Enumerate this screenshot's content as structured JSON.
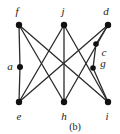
{
  "figure": {
    "caption": "(b)",
    "width": 120,
    "height": 134,
    "background": "#ffffff",
    "edge_color": "#2b2b2b",
    "vertex_color": "#111111",
    "label_color": "#1a1a1a"
  },
  "chart_data": {
    "type": "diagram",
    "subtype": "undirected-graph",
    "title": "(b)",
    "vertices": [
      {
        "id": "f",
        "label": "f",
        "x": 19,
        "y": 25,
        "label_x": 17,
        "label_y": 11,
        "r": 3.2
      },
      {
        "id": "j",
        "label": "j",
        "x": 64,
        "y": 25,
        "label_x": 63,
        "label_y": 11,
        "r": 3.2
      },
      {
        "id": "d",
        "label": "d",
        "x": 108,
        "y": 25,
        "label_x": 106,
        "label_y": 11,
        "r": 3.2
      },
      {
        "id": "a",
        "label": "a",
        "x": 20,
        "y": 67,
        "label_x": 10,
        "label_y": 66,
        "r": 3.0
      },
      {
        "id": "c",
        "label": "c",
        "x": 96,
        "y": 44,
        "label_x": 104,
        "label_y": 52,
        "r": 2.8
      },
      {
        "id": "g",
        "label": "g",
        "x": 93,
        "y": 68,
        "label_x": 103,
        "label_y": 63,
        "r": 2.8
      },
      {
        "id": "e",
        "label": "e",
        "x": 19,
        "y": 102,
        "label_x": 19,
        "label_y": 116,
        "r": 3.2
      },
      {
        "id": "h",
        "label": "h",
        "x": 64,
        "y": 102,
        "label_x": 64,
        "label_y": 116,
        "r": 3.2
      },
      {
        "id": "i",
        "label": "i",
        "x": 108,
        "y": 102,
        "label_x": 107,
        "label_y": 116,
        "r": 3.2
      }
    ],
    "edges": [
      {
        "from": "f",
        "to": "a"
      },
      {
        "from": "a",
        "to": "e"
      },
      {
        "from": "f",
        "to": "h"
      },
      {
        "from": "f",
        "to": "i"
      },
      {
        "from": "j",
        "to": "h"
      },
      {
        "from": "j",
        "to": "e"
      },
      {
        "from": "j",
        "to": "i"
      },
      {
        "from": "d",
        "to": "c"
      },
      {
        "from": "c",
        "to": "g"
      },
      {
        "from": "g",
        "to": "i"
      },
      {
        "from": "d",
        "to": "e"
      },
      {
        "from": "d",
        "to": "h"
      }
    ],
    "xlabel": "",
    "ylabel": "",
    "legend": []
  }
}
